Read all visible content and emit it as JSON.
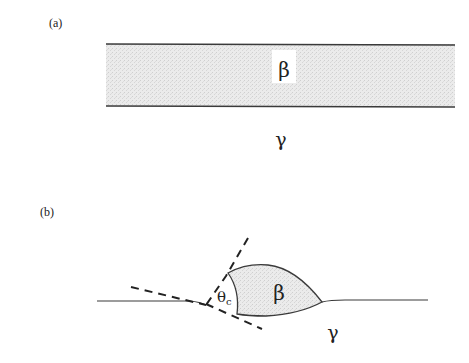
{
  "figure": {
    "panel_a": {
      "label": "(a)",
      "layer_phase": "β",
      "matrix_phase": "γ"
    },
    "panel_b": {
      "label": "(b)",
      "particle_phase": "β",
      "matrix_phase": "γ",
      "angle_symbol": "θ",
      "angle_subscript": "c"
    },
    "colors": {
      "line": "#3a3a3a",
      "fill": "#e6e6e6",
      "background": "#ffffff"
    }
  }
}
